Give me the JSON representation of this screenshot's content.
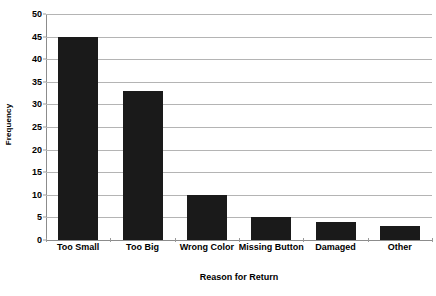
{
  "chart_data": {
    "type": "bar",
    "title": "",
    "xlabel": "Reason for Return",
    "ylabel": "Frequency",
    "categories": [
      "Too Small",
      "Too Big",
      "Wrong Color",
      "Missing Button",
      "Damaged",
      "Other"
    ],
    "values": [
      45,
      33,
      10,
      5,
      4,
      3
    ],
    "ylim": [
      0,
      50
    ],
    "ytick_labels": [
      "0",
      "5",
      "10",
      "15",
      "20",
      "25",
      "30",
      "35",
      "40",
      "45",
      "50"
    ],
    "ytick_values": [
      0,
      5,
      10,
      15,
      20,
      25,
      30,
      35,
      40,
      45,
      50
    ],
    "grid": true,
    "legend": "none",
    "bar_color": "#1a1a1a",
    "gridline_color": "#b4b4b4",
    "axis_color": "#8c8c8c",
    "background_color": "#ffffff"
  }
}
